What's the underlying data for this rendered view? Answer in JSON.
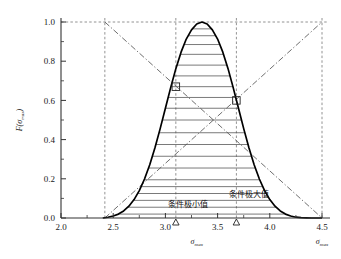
{
  "chart_data": {
    "type": "line",
    "title": "",
    "subtitle": "",
    "xlabel": "σ",
    "xlabel_sub": "max",
    "ylabel": "F(σ",
    "ylabel_sub": "max",
    "ylabel_close": ")",
    "xlim": [
      2.0,
      4.5
    ],
    "ylim": [
      0.0,
      1.0
    ],
    "grid": false,
    "legend": "none",
    "x_ticks": [
      "2.0",
      "2.5",
      "3.0",
      "3.5",
      "4.0",
      "4.5"
    ],
    "x_tick_values": [
      2.0,
      2.5,
      3.0,
      3.5,
      4.0,
      4.5
    ],
    "y_ticks": [
      "0.0",
      "0.2",
      "0.4",
      "0.6",
      "0.8",
      "1.0"
    ],
    "y_tick_values": [
      0.0,
      0.2,
      0.4,
      0.6,
      0.8,
      1.0
    ],
    "x_minor_step": 0.1,
    "y_minor_step": 0.05,
    "series": [
      {
        "name": "density-curve",
        "style": "solid-thick",
        "color": "#000000",
        "x": [
          2.4,
          2.45,
          2.5,
          2.55,
          2.6,
          2.65,
          2.7,
          2.75,
          2.8,
          2.85,
          2.9,
          2.95,
          3.0,
          3.05,
          3.1,
          3.15,
          3.2,
          3.25,
          3.3,
          3.35,
          3.4,
          3.45,
          3.5,
          3.55,
          3.6,
          3.65,
          3.7,
          3.75,
          3.8,
          3.85,
          3.9,
          3.95,
          4.0,
          4.05,
          4.1,
          4.15,
          4.2,
          4.25,
          4.3,
          4.35,
          4.4,
          4.45,
          4.5
        ],
        "y": [
          0.0,
          0.004,
          0.01,
          0.02,
          0.036,
          0.06,
          0.094,
          0.14,
          0.199,
          0.272,
          0.358,
          0.456,
          0.56,
          0.664,
          0.762,
          0.846,
          0.913,
          0.96,
          0.99,
          1.0,
          0.99,
          0.96,
          0.913,
          0.846,
          0.762,
          0.664,
          0.56,
          0.456,
          0.358,
          0.272,
          0.199,
          0.14,
          0.094,
          0.06,
          0.036,
          0.02,
          0.01,
          0.004,
          0.002,
          0.001,
          0.0,
          0.0,
          0.0
        ]
      },
      {
        "name": "descending-diagonal",
        "style": "dash-dot",
        "color": "#555555",
        "x": [
          2.42,
          4.5
        ],
        "y": [
          1.0,
          0.0
        ]
      },
      {
        "name": "ascending-diagonal",
        "style": "dash-dot",
        "color": "#555555",
        "x": [
          2.42,
          4.5
        ],
        "y": [
          0.0,
          1.0
        ]
      }
    ],
    "hatch_fill": {
      "under": "density-curve",
      "orientation": "horizontal",
      "line_color": "#4d4d4d",
      "levels": [
        0.02,
        0.055,
        0.09,
        0.125,
        0.16,
        0.195,
        0.255,
        0.315,
        0.375,
        0.435,
        0.5,
        0.56,
        0.615,
        0.67,
        0.725,
        0.78,
        0.835,
        0.885,
        0.93,
        0.965
      ]
    },
    "reference_lines": [
      {
        "name": "vline-left-bound",
        "orientation": "vertical",
        "value": 2.42,
        "style": "dashed",
        "color": "#777777"
      },
      {
        "name": "vline-cond-min",
        "orientation": "vertical",
        "value": 3.1,
        "style": "dashed",
        "color": "#777777"
      },
      {
        "name": "vline-cond-max",
        "orientation": "vertical",
        "value": 3.68,
        "style": "dashed",
        "color": "#777777"
      },
      {
        "name": "vline-right-bound",
        "orientation": "vertical",
        "value": 4.5,
        "style": "dashed",
        "color": "#777777"
      },
      {
        "name": "hline-unity",
        "orientation": "horizontal",
        "value": 1.0,
        "style": "dashed",
        "color": "#777777"
      }
    ],
    "markers": [
      {
        "name": "square-marker-cond-min",
        "shape": "square",
        "x": 3.1,
        "y": 0.67
      },
      {
        "name": "square-marker-cond-max",
        "shape": "square",
        "x": 3.68,
        "y": 0.6
      },
      {
        "name": "triangle-tick-cond-min",
        "shape": "triangle",
        "x": 3.1,
        "y": 0.0
      },
      {
        "name": "triangle-tick-cond-max",
        "shape": "triangle",
        "x": 3.68,
        "y": 0.0
      }
    ],
    "annotations": [
      {
        "name": "annotation-conditional-minimum",
        "text": "条件极小值",
        "x": 3.22,
        "y": 0.055
      },
      {
        "name": "annotation-conditional-maximum",
        "text": "条件极大值",
        "x": 3.8,
        "y": 0.105
      }
    ],
    "axis_end_labels": [
      {
        "name": "x-axis-symbol-center",
        "text": "σ",
        "sub": "max",
        "x": 3.3
      },
      {
        "name": "x-axis-symbol-right",
        "text": "σ",
        "sub": "max",
        "x": 4.52
      }
    ]
  }
}
